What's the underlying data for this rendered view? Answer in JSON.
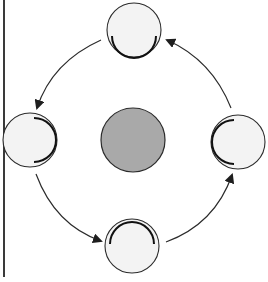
{
  "diagram": {
    "type": "cycle",
    "colors": {
      "background": "#ffffff",
      "stroke": "#2b2b2b",
      "node_fill": "#f3f3f3",
      "center_fill": "#a9a9a9",
      "border_line": "#3a3a3a"
    },
    "center": {
      "cx": 133,
      "cy": 140,
      "r": 32
    },
    "nodes": [
      {
        "id": "top",
        "cx": 134,
        "cy": 30,
        "r": 27,
        "arc_side": "bottom"
      },
      {
        "id": "left",
        "cx": 30,
        "cy": 140,
        "r": 27,
        "arc_side": "right"
      },
      {
        "id": "bottom",
        "cx": 132,
        "cy": 246,
        "r": 27,
        "arc_side": "top"
      },
      {
        "id": "right",
        "cx": 238,
        "cy": 142,
        "r": 27,
        "arc_side": "left"
      }
    ],
    "arrows": [
      {
        "from": "top",
        "to": "left"
      },
      {
        "from": "left",
        "to": "bottom"
      },
      {
        "from": "bottom",
        "to": "right"
      },
      {
        "from": "right",
        "to": "top"
      }
    ],
    "direction": "counter-clockwise"
  }
}
